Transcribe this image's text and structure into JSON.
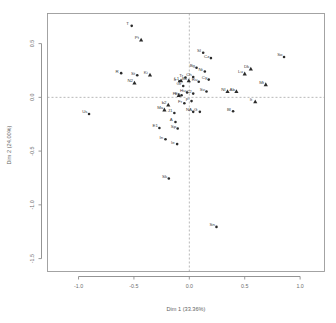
{
  "chart_data": {
    "type": "scatter",
    "title": "",
    "subtitle": "",
    "xlabel": "Dim 1 (33.36%)",
    "ylabel": "Dim 2 (24.00%)",
    "xlim": [
      -1.28,
      1.22
    ],
    "ylim": [
      -1.62,
      0.78
    ],
    "xticks": [
      -1.0,
      -0.5,
      0.0,
      0.5,
      1.0
    ],
    "xticklabels": [
      "-1.0",
      "-0.5",
      "0.0",
      "0.5",
      "1.0"
    ],
    "yticks": [
      0.5,
      0.0,
      -0.5,
      -1.0,
      -1.5
    ],
    "yticklabels": [
      "0.5",
      "0.0",
      "-0.5",
      "-1.0",
      "-1.5"
    ],
    "grid": false,
    "legend": "none",
    "reference_lines": {
      "vertical_x": 0.0,
      "horizontal_y": 0.0,
      "style": "dashed"
    },
    "series": [
      {
        "name": "individuals",
        "marker": "circle",
        "points": [
          {
            "label": "T",
            "x": -0.52,
            "y": 0.665
          },
          {
            "label": "R",
            "x": -0.615,
            "y": 0.225
          },
          {
            "label": "St",
            "x": -0.47,
            "y": 0.205
          },
          {
            "label": "Us",
            "x": -0.905,
            "y": -0.155
          },
          {
            "label": "So",
            "x": 0.855,
            "y": 0.375
          },
          {
            "label": "Cz",
            "x": 0.195,
            "y": 0.365
          },
          {
            "label": "Sl",
            "x": 0.125,
            "y": 0.415
          },
          {
            "label": "Bg",
            "x": 0.065,
            "y": 0.275
          },
          {
            "label": "Nt",
            "x": 0.14,
            "y": 0.24
          },
          {
            "label": "Cy",
            "x": 0.175,
            "y": 0.165
          },
          {
            "label": "Ch",
            "x": 0.035,
            "y": 0.19
          },
          {
            "label": "Ru",
            "x": 0.085,
            "y": 0.145
          },
          {
            "label": "Tr",
            "x": -0.035,
            "y": 0.185
          },
          {
            "label": "Ir",
            "x": -0.09,
            "y": 0.15
          },
          {
            "label": "Gr",
            "x": -0.055,
            "y": 0.105
          },
          {
            "label": "Sv",
            "x": 0.155,
            "y": 0.055
          },
          {
            "label": "Hu",
            "x": -0.02,
            "y": 0.045
          },
          {
            "label": "C2",
            "x": 0.035,
            "y": 0.035
          },
          {
            "label": "Ee",
            "x": -0.07,
            "y": 0.02
          },
          {
            "label": "P",
            "x": 0.02,
            "y": -0.035
          },
          {
            "label": "Fr",
            "x": -0.045,
            "y": -0.055
          },
          {
            "label": "NA",
            "x": 0.035,
            "y": -0.135
          },
          {
            "label": "G",
            "x": 0.095,
            "y": -0.135
          },
          {
            "label": "J1",
            "x": -0.135,
            "y": -0.145
          },
          {
            "label": "Bl",
            "x": 0.395,
            "y": -0.13
          },
          {
            "label": "E1",
            "x": -0.27,
            "y": -0.285
          },
          {
            "label": "Sp",
            "x": -0.105,
            "y": -0.29
          },
          {
            "label": "A",
            "x": -0.125,
            "y": -0.23
          },
          {
            "label": "In",
            "x": -0.215,
            "y": -0.39
          },
          {
            "label": "Ie",
            "x": -0.11,
            "y": -0.435
          },
          {
            "label": "Sk",
            "x": -0.185,
            "y": -0.755
          },
          {
            "label": "Sn",
            "x": 0.245,
            "y": -1.205
          }
        ]
      },
      {
        "name": "supplementary",
        "marker": "triangle",
        "points": [
          {
            "label": "Pt",
            "x": -0.435,
            "y": 0.535
          },
          {
            "label": "N2",
            "x": -0.495,
            "y": 0.135
          },
          {
            "label": "Ki",
            "x": -0.355,
            "y": 0.21
          },
          {
            "label": "L1",
            "x": -0.075,
            "y": 0.155
          },
          {
            "label": "Bk",
            "x": -0.005,
            "y": 0.155
          },
          {
            "label": "Lu",
            "x": 0.5,
            "y": 0.22
          },
          {
            "label": "Dk",
            "x": 0.555,
            "y": 0.265
          },
          {
            "label": "Mt",
            "x": 0.69,
            "y": 0.12
          },
          {
            "label": "Nl",
            "x": 0.345,
            "y": 0.055
          },
          {
            "label": "Ab",
            "x": 0.425,
            "y": 0.055
          },
          {
            "label": "It",
            "x": 0.595,
            "y": -0.04
          },
          {
            "label": "b2",
            "x": -0.19,
            "y": -0.07
          },
          {
            "label": "Ma",
            "x": -0.225,
            "y": -0.115
          },
          {
            "label": "Fi",
            "x": -0.095,
            "y": 0.02
          }
        ]
      }
    ]
  },
  "figure": {
    "axis_x_title": "Dim 1 (33.36%)",
    "axis_y_title": "Dim 2 (24.00%)"
  }
}
